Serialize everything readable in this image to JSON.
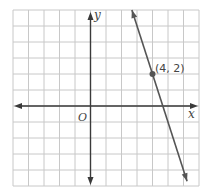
{
  "chart_data": {
    "type": "line",
    "title": "",
    "xlabel": "x",
    "ylabel": "y",
    "origin_label": "O",
    "xlim": [
      -5,
      7
    ],
    "ylim": [
      -5,
      6
    ],
    "grid": true,
    "grid_step": 1,
    "tick_labels": false,
    "series": [
      {
        "name": "line",
        "equation": "y = -3x + 14",
        "slope": -3,
        "intercept": 14,
        "x": [
          2.67,
          6.23
        ],
        "y": [
          6,
          -4.7
        ],
        "arrows_both_ends": true
      }
    ],
    "annotations": [
      {
        "x": 4,
        "y": 2,
        "label": "(4, 2)",
        "marker": "point"
      }
    ]
  },
  "colors": {
    "grid": "#c8c8c8",
    "axes": "#3a3a3a",
    "line": "#555555",
    "point": "#555555",
    "text": "#444444"
  }
}
